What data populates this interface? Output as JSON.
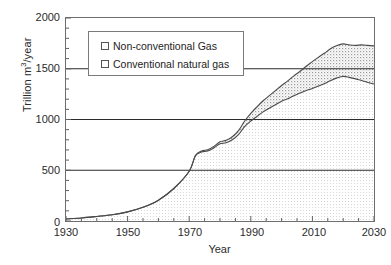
{
  "chart_data": {
    "type": "area",
    "title": "",
    "subtitle": "",
    "xlabel": "Year",
    "ylabel": "Trillion m³/year",
    "xlim": [
      1930,
      2030
    ],
    "ylim": [
      0,
      2000
    ],
    "xticks": [
      1930,
      1950,
      1970,
      1990,
      2010,
      2030
    ],
    "yticks": [
      0,
      500,
      1000,
      1500,
      2000
    ],
    "minor_xtick_interval": 5,
    "minor_ytick_interval": 100,
    "grid": "horizontal-major-only",
    "gridlines_y": [
      500,
      1000,
      1500
    ],
    "legend_position": "upper-left-inside",
    "stacked": true,
    "legend": [
      {
        "label": "Non-conventional Gas",
        "swatch": "dotted-hatch"
      },
      {
        "label": "Conventional natural gas",
        "swatch": "white"
      }
    ],
    "x": [
      1930,
      1935,
      1940,
      1945,
      1950,
      1955,
      1960,
      1965,
      1970,
      1972,
      1974,
      1976,
      1978,
      1980,
      1982,
      1984,
      1986,
      1988,
      1990,
      1992,
      1994,
      1996,
      1998,
      2000,
      2002,
      2004,
      2006,
      2008,
      2010,
      2012,
      2014,
      2016,
      2018,
      2020,
      2022,
      2024,
      2026,
      2028,
      2030
    ],
    "series": [
      {
        "name": "Conventional natural gas",
        "values": [
          20,
          30,
          45,
          62,
          90,
          135,
          205,
          320,
          490,
          640,
          680,
          690,
          720,
          760,
          770,
          800,
          850,
          930,
          985,
          1030,
          1075,
          1110,
          1145,
          1180,
          1205,
          1235,
          1260,
          1285,
          1305,
          1330,
          1355,
          1385,
          1410,
          1425,
          1415,
          1400,
          1385,
          1365,
          1350
        ]
      },
      {
        "name": "Non-conventional Gas",
        "values": [
          0,
          0,
          0,
          0,
          0,
          0,
          0,
          0,
          0,
          5,
          10,
          12,
          15,
          20,
          25,
          30,
          40,
          55,
          75,
          95,
          110,
          125,
          140,
          155,
          175,
          195,
          215,
          240,
          265,
          285,
          300,
          315,
          320,
          320,
          320,
          330,
          350,
          365,
          375
        ]
      }
    ],
    "totals": [
      20,
      30,
      45,
      62,
      90,
      135,
      205,
      320,
      490,
      645,
      690,
      702,
      735,
      780,
      795,
      830,
      890,
      985,
      1060,
      1125,
      1185,
      1235,
      1285,
      1335,
      1380,
      1430,
      1475,
      1525,
      1570,
      1615,
      1655,
      1700,
      1730,
      1745,
      1735,
      1730,
      1735,
      1730,
      1725
    ]
  },
  "axis": {
    "y_title": "Trillion m",
    "y_title_sup": "3",
    "y_title_rest": "/year",
    "x_title": "Year",
    "ytick_labels": [
      "2000",
      "1500",
      "1000",
      "500",
      "0"
    ],
    "xtick_labels": [
      "1930",
      "1950",
      "1970",
      "1990",
      "2010",
      "2030"
    ]
  },
  "legend": {
    "items": [
      {
        "label": "Non-conventional Gas"
      },
      {
        "label": "Conventional natural gas"
      }
    ]
  },
  "colors": {
    "axis": "#6e6e6e",
    "gridline": "#2b2b2b",
    "curve": "#4a4a4a",
    "text": "#1d1d1d",
    "background": "#ffffff",
    "conventional_fill": "#fbfbfb",
    "nonconventional_fill": "#f2f2f2"
  }
}
